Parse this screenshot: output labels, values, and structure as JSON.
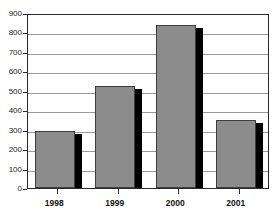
{
  "chart_data": {
    "type": "bar",
    "title": "",
    "xlabel": "",
    "ylabel": "",
    "categories": [
      "1998",
      "1999",
      "2000",
      "2001"
    ],
    "values": [
      292,
      525,
      838,
      349
    ],
    "ylim": [
      0,
      900
    ],
    "ytick_labels": [
      "0",
      "100",
      "200",
      "300",
      "400",
      "500",
      "600",
      "700",
      "800",
      "900"
    ],
    "ytick_values": [
      0,
      100,
      200,
      300,
      400,
      500,
      600,
      700,
      800,
      900
    ],
    "grid": "horizontal",
    "legend": "none",
    "bar_style": "3d-shadow",
    "colors": {
      "bar_face": "#8c8c8c",
      "bar_shadow": "#000000",
      "bar_outline": "#3d3d3d",
      "gridline": "#9a9a9a",
      "frame": "#2b2b2b",
      "text": "#111111",
      "background": "#ffffff"
    }
  }
}
